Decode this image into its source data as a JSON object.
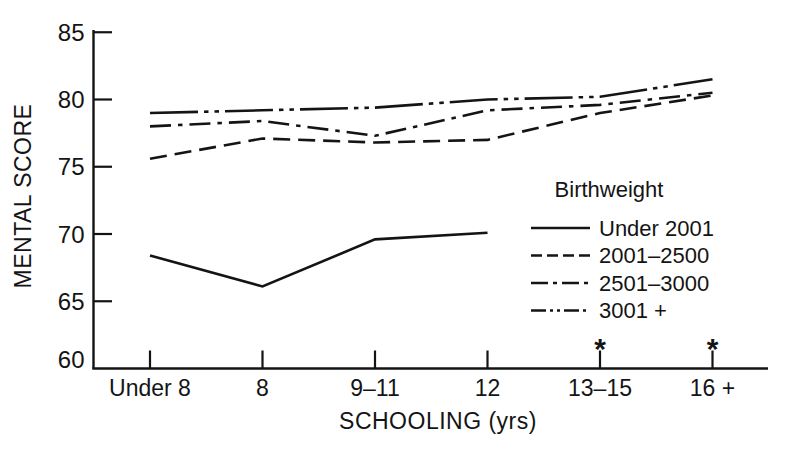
{
  "figure": {
    "background": "#ffffff",
    "ink_color": "#141414"
  },
  "chart_data": {
    "type": "line",
    "title": "",
    "xlabel": "SCHOOLING (yrs)",
    "ylabel": "MENTAL SCORE",
    "categories": [
      "Under 8",
      "8",
      "9–11",
      "12",
      "13–15",
      "16 +"
    ],
    "y_ticks": [
      60,
      65,
      70,
      75,
      80,
      85
    ],
    "ylim": [
      60,
      85
    ],
    "grid": false,
    "legend": {
      "title": "Birthweight",
      "position": "inside-right"
    },
    "series": [
      {
        "name": "Under 2001",
        "line_style": "solid",
        "values": [
          68.4,
          66.1,
          69.6,
          70.1,
          null,
          null
        ]
      },
      {
        "name": "2001–2500",
        "line_style": "dashed",
        "values": [
          75.6,
          77.1,
          76.8,
          77.0,
          79.0,
          80.3
        ]
      },
      {
        "name": "2501–3000",
        "line_style": "dash-dot",
        "values": [
          78.0,
          78.4,
          77.3,
          79.2,
          79.6,
          80.5
        ]
      },
      {
        "name": "3001 +",
        "line_style": "dash-dot-dot",
        "values": [
          79.0,
          79.2,
          79.4,
          80.0,
          80.2,
          81.5
        ]
      }
    ],
    "annotations": [
      {
        "text": "*",
        "category_index": 4
      },
      {
        "text": "*",
        "category_index": 5
      }
    ]
  }
}
